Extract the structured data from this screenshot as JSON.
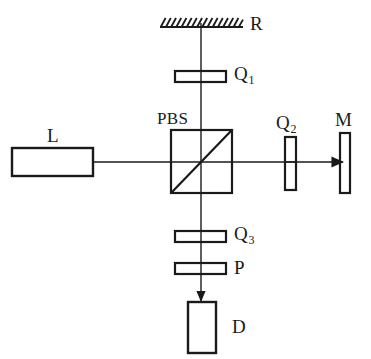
{
  "figure": {
    "kind": "optical-setup-diagram",
    "stroke_color": "#1a1a1a",
    "background_color": "#ffffff"
  },
  "labels": {
    "mirror_r": "R",
    "waveplate_q1_letter": "Q",
    "waveplate_q1_sub": "1",
    "beamsplitter": "PBS",
    "laser": "L",
    "waveplate_q2_letter": "Q",
    "waveplate_q2_sub": "2",
    "mirror_m": "M",
    "waveplate_q3_letter": "Q",
    "waveplate_q3_sub": "3",
    "polarizer": "P",
    "detector": "D"
  },
  "components": {
    "laser_source": {
      "name": "L",
      "shape": "rectangle",
      "x": 12,
      "y": 148,
      "width": 81,
      "height": 28
    },
    "beam_splitter": {
      "name": "PBS",
      "shape": "square-with-diagonal",
      "x": 171,
      "y": 130,
      "width": 61,
      "height": 63
    },
    "reference_mirror": {
      "name": "R",
      "shape": "hatched-mirror",
      "x": 160,
      "y": 22,
      "width": 83,
      "hatch_count": 16
    },
    "measurement_mirror": {
      "name": "M",
      "shape": "vertical-bar",
      "x": 340,
      "y": 133,
      "width": 10,
      "height": 60
    },
    "quarter_waveplate_1": {
      "name": "Q1",
      "shape": "horizontal-plate",
      "x": 175,
      "y": 71,
      "width": 51,
      "height": 11
    },
    "quarter_waveplate_2": {
      "name": "Q2",
      "shape": "vertical-plate",
      "x": 285,
      "y": 137,
      "width": 11,
      "height": 53
    },
    "quarter_waveplate_3": {
      "name": "Q3",
      "shape": "horizontal-plate",
      "x": 175,
      "y": 231,
      "width": 51,
      "height": 11
    },
    "polarizer_p": {
      "name": "P",
      "shape": "horizontal-plate",
      "x": 175,
      "y": 263,
      "width": 51,
      "height": 11
    },
    "detector_d": {
      "name": "D",
      "shape": "rectangle",
      "x": 188,
      "y": 302,
      "width": 28,
      "height": 51
    }
  },
  "beams": {
    "horizontal_axis_y": 162,
    "vertical_axis_x": 201,
    "laser_to_pbs": {
      "x1": 93,
      "y1": 162,
      "x2": 201,
      "y2": 162
    },
    "pbs_to_mirror_m": {
      "x1": 201,
      "y1": 162,
      "x2": 344,
      "y2": 162,
      "arrow": "right"
    },
    "pbs_to_mirror_r": {
      "x1": 201,
      "y1": 162,
      "x2": 201,
      "y2": 22
    },
    "pbs_to_detector": {
      "x1": 201,
      "y1": 162,
      "x2": 201,
      "y2": 302,
      "arrow": "down"
    }
  }
}
